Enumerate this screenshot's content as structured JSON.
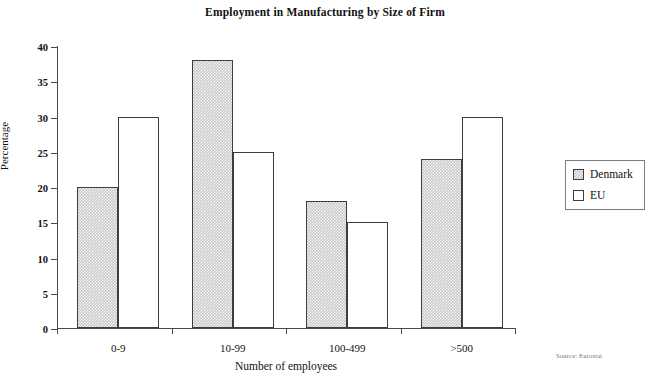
{
  "chart_data": {
    "type": "bar",
    "title": "Employment in Manufacturing by Size of Firm",
    "xlabel": "Number of employees",
    "ylabel": "Percentage",
    "categories": [
      "0-9",
      "10-99",
      "100-499",
      ">500"
    ],
    "series": [
      {
        "name": "Denmark",
        "values": [
          20,
          38,
          18,
          24
        ],
        "color": "#c9c9c9",
        "fill": "stippled-gray"
      },
      {
        "name": "EU",
        "values": [
          30,
          25,
          15,
          30
        ],
        "color": "#ffffff",
        "fill": "white"
      }
    ],
    "ylim": [
      0,
      40
    ],
    "yticks": [
      0,
      5,
      10,
      15,
      20,
      25,
      30,
      35,
      40
    ],
    "ytick_labels": [
      "0",
      "5",
      "10",
      "15",
      "20",
      "25",
      "30",
      "35",
      "40"
    ],
    "grid": false,
    "legend_position": "right",
    "annotation": "Source: Eurostat"
  },
  "legend": {
    "entries": [
      {
        "label": "Denmark"
      },
      {
        "label": "EU"
      }
    ]
  },
  "source": {
    "note": "Source: Eurostat"
  }
}
